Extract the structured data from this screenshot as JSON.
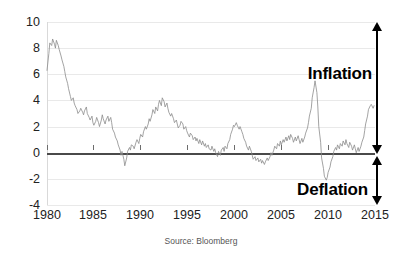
{
  "chart_data": {
    "type": "line",
    "title": "",
    "subtitle": "",
    "xlabel": "",
    "ylabel": "",
    "xlim": [
      1980,
      2015
    ],
    "ylim": [
      -4,
      10
    ],
    "grid": true,
    "legend": "none",
    "source_note": "Source: Bloomberg",
    "yticks": [
      10,
      8,
      6,
      4,
      2,
      0,
      -2,
      -4
    ],
    "xticks": [
      1980,
      1985,
      1990,
      1995,
      2000,
      2005,
      2010,
      2015
    ],
    "ytick_labels": [
      "10",
      "8",
      "6",
      "4",
      "2",
      "0",
      "-2",
      "-4"
    ],
    "xtick_labels": [
      "1980",
      "1985",
      "1990",
      "1995",
      "2000",
      "2005",
      "2010",
      "2015"
    ],
    "zero_reference_line": 0,
    "series": [
      {
        "name": "Inflation rate",
        "color": "#8c8c8c",
        "x": [
          1980.0,
          1980.2,
          1980.3,
          1980.5,
          1980.6,
          1980.8,
          1980.9,
          1981.0,
          1981.2,
          1981.3,
          1981.5,
          1981.6,
          1981.8,
          1981.9,
          1982.0,
          1982.2,
          1982.3,
          1982.5,
          1982.6,
          1982.8,
          1982.9,
          1983.0,
          1983.2,
          1983.3,
          1983.5,
          1983.6,
          1983.8,
          1983.9,
          1984.0,
          1984.2,
          1984.3,
          1984.5,
          1984.6,
          1984.8,
          1984.9,
          1985.0,
          1985.2,
          1985.3,
          1985.5,
          1985.6,
          1985.8,
          1985.9,
          1986.0,
          1986.2,
          1986.3,
          1986.5,
          1986.6,
          1986.8,
          1986.9,
          1987.0,
          1987.2,
          1987.3,
          1987.5,
          1987.6,
          1987.8,
          1987.9,
          1988.0,
          1988.2,
          1988.3,
          1988.5,
          1988.6,
          1988.8,
          1988.9,
          1989.0,
          1989.2,
          1989.3,
          1989.5,
          1989.6,
          1989.8,
          1989.9,
          1990.0,
          1990.2,
          1990.3,
          1990.5,
          1990.6,
          1990.8,
          1990.9,
          1991.0,
          1991.2,
          1991.3,
          1991.5,
          1991.6,
          1991.8,
          1991.9,
          1992.0,
          1992.2,
          1992.3,
          1992.5,
          1992.6,
          1992.8,
          1992.9,
          1993.0,
          1993.2,
          1993.3,
          1993.5,
          1993.6,
          1993.8,
          1993.9,
          1994.0,
          1994.2,
          1994.3,
          1994.5,
          1994.6,
          1994.8,
          1994.9,
          1995.0,
          1995.2,
          1995.3,
          1995.5,
          1995.6,
          1995.8,
          1995.9,
          1996.0,
          1996.2,
          1996.3,
          1996.5,
          1996.6,
          1996.8,
          1996.9,
          1997.0,
          1997.2,
          1997.3,
          1997.5,
          1997.6,
          1997.8,
          1997.9,
          1998.0,
          1998.2,
          1998.3,
          1998.5,
          1998.6,
          1998.8,
          1998.9,
          1999.0,
          1999.2,
          1999.3,
          1999.5,
          1999.6,
          1999.8,
          1999.9,
          2000.0,
          2000.2,
          2000.3,
          2000.5,
          2000.6,
          2000.8,
          2000.9,
          2001.0,
          2001.2,
          2001.3,
          2001.5,
          2001.6,
          2001.8,
          2001.9,
          2002.0,
          2002.2,
          2002.3,
          2002.5,
          2002.6,
          2002.8,
          2002.9,
          2003.0,
          2003.2,
          2003.3,
          2003.5,
          2003.6,
          2003.8,
          2003.9,
          2004.0,
          2004.2,
          2004.3,
          2004.5,
          2004.6,
          2004.8,
          2004.9,
          2005.0,
          2005.2,
          2005.3,
          2005.5,
          2005.6,
          2005.8,
          2005.9,
          2006.0,
          2006.2,
          2006.3,
          2006.5,
          2006.6,
          2006.8,
          2006.9,
          2007.0,
          2007.2,
          2007.3,
          2007.5,
          2007.6,
          2007.8,
          2007.9,
          2008.0,
          2008.2,
          2008.3,
          2008.5,
          2008.6,
          2008.8,
          2008.9,
          2009.0,
          2009.2,
          2009.3,
          2009.5,
          2009.6,
          2009.8,
          2009.9,
          2010.0,
          2010.2,
          2010.3,
          2010.5,
          2010.6,
          2010.8,
          2010.9,
          2011.0,
          2011.2,
          2011.3,
          2011.5,
          2011.6,
          2011.8,
          2011.9,
          2012.0,
          2012.2,
          2012.3,
          2012.5,
          2012.6,
          2012.8,
          2012.9,
          2013.0,
          2013.2,
          2013.3,
          2013.5,
          2013.6,
          2013.8,
          2013.9,
          2014.0,
          2014.2,
          2014.3,
          2014.5,
          2014.6,
          2014.8,
          2014.9
        ],
        "y": [
          6.3,
          7.6,
          8.4,
          8.2,
          8.7,
          8.3,
          8.0,
          8.6,
          8.2,
          7.9,
          7.4,
          7.1,
          6.6,
          6.2,
          5.8,
          5.3,
          4.9,
          4.3,
          4.0,
          4.2,
          3.8,
          3.6,
          3.3,
          3.0,
          3.2,
          3.4,
          3.1,
          2.9,
          3.2,
          3.5,
          3.0,
          2.7,
          2.5,
          2.8,
          2.3,
          2.1,
          2.4,
          2.7,
          2.3,
          2.0,
          2.5,
          2.9,
          2.6,
          2.2,
          2.5,
          2.8,
          2.4,
          2.7,
          2.3,
          1.8,
          1.5,
          1.2,
          0.9,
          0.6,
          0.2,
          -0.2,
          0.1,
          -0.5,
          -1.0,
          -0.4,
          0.1,
          0.4,
          0.2,
          0.6,
          0.5,
          0.3,
          0.8,
          1.0,
          0.7,
          1.1,
          1.4,
          1.2,
          1.6,
          2.0,
          1.8,
          2.2,
          2.6,
          2.4,
          2.9,
          3.3,
          3.0,
          3.5,
          3.2,
          3.7,
          4.0,
          3.6,
          4.2,
          3.9,
          3.5,
          3.8,
          3.4,
          3.1,
          2.8,
          3.0,
          2.6,
          2.3,
          2.5,
          2.2,
          1.9,
          2.1,
          2.4,
          2.2,
          1.8,
          2.0,
          1.7,
          1.5,
          1.2,
          1.5,
          1.3,
          1.0,
          1.2,
          0.9,
          1.1,
          0.7,
          1.0,
          0.6,
          0.9,
          0.5,
          0.7,
          0.4,
          0.6,
          0.3,
          0.2,
          0.5,
          0.1,
          0.3,
          0.0,
          -0.3,
          0.1,
          -0.2,
          0.2,
          0.4,
          0.1,
          0.5,
          0.3,
          0.7,
          1.0,
          1.4,
          1.8,
          2.1,
          2.0,
          2.3,
          2.1,
          1.8,
          2.0,
          1.6,
          1.4,
          1.1,
          0.8,
          0.5,
          0.2,
          0.5,
          0.1,
          -0.2,
          -0.5,
          -0.3,
          -0.6,
          -0.4,
          -0.7,
          -0.5,
          -0.8,
          -0.6,
          -0.9,
          -0.7,
          -0.4,
          -0.6,
          -0.3,
          0.0,
          -0.2,
          0.2,
          0.5,
          0.3,
          0.7,
          0.5,
          0.9,
          0.6,
          1.0,
          0.8,
          1.2,
          0.9,
          1.3,
          1.0,
          1.4,
          1.1,
          0.8,
          1.2,
          0.9,
          1.3,
          1.0,
          0.7,
          1.1,
          0.8,
          1.2,
          1.5,
          1.9,
          2.3,
          2.8,
          3.4,
          4.2,
          5.0,
          5.5,
          4.6,
          3.5,
          2.0,
          0.8,
          -0.4,
          -1.2,
          -1.8,
          -2.1,
          -1.9,
          -1.5,
          -1.1,
          -0.7,
          -0.3,
          0.1,
          0.4,
          0.2,
          0.6,
          0.3,
          0.7,
          0.5,
          0.9,
          0.6,
          1.0,
          0.7,
          0.4,
          0.8,
          0.5,
          0.2,
          0.6,
          0.3,
          0.0,
          0.4,
          0.1,
          0.5,
          0.8,
          1.2,
          1.7,
          2.2,
          2.8,
          3.3,
          3.6,
          3.7,
          3.4,
          3.6
        ]
      }
    ],
    "annotations": [
      {
        "name": "inflation-band",
        "label": "Inflation",
        "region": "above-zero",
        "arrow": "double-headed-vertical",
        "range": [
          0,
          10
        ]
      },
      {
        "name": "deflation-band",
        "label": "Deflation",
        "region": "below-zero",
        "arrow": "double-headed-vertical",
        "range": [
          -4,
          0
        ]
      }
    ],
    "colors": {
      "line": "#8c8c8c",
      "grid": "#e9e9e9",
      "zero_line": "#4a4a4a",
      "annotation": "#000000",
      "background": "#ffffff"
    }
  }
}
